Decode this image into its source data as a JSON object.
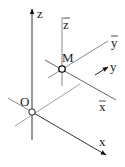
{
  "diagram": {
    "type": "coordinate-axes",
    "labels": {
      "origin": "O",
      "point": "M",
      "x": "x",
      "y": "y",
      "z": "z",
      "x_bar": "x",
      "y_bar": "y",
      "z_bar": "z"
    },
    "colors": {
      "axis_dark": "#333333",
      "axis_light": "#888888",
      "background": "#ffffff"
    }
  }
}
